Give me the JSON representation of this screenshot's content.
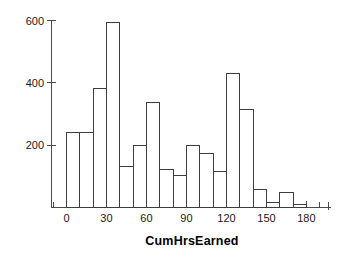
{
  "chart_data": {
    "type": "bar",
    "title": "",
    "subtitle": "",
    "xlabel": "CumHrsEarned",
    "ylabel": "",
    "categories": [
      "0",
      "10",
      "20",
      "30",
      "40",
      "50",
      "60",
      "70",
      "80",
      "90",
      "100",
      "110",
      "120",
      "130",
      "140",
      "150",
      "160",
      "170"
    ],
    "bin_starts": [
      0,
      10,
      20,
      30,
      40,
      50,
      60,
      70,
      80,
      90,
      100,
      110,
      120,
      130,
      140,
      150,
      160,
      170
    ],
    "bin_width": 10,
    "values": [
      240,
      240,
      382,
      592,
      133,
      198,
      338,
      122,
      103,
      200,
      172,
      115,
      430,
      315,
      58,
      15,
      47,
      10
    ],
    "xlim": [
      -10,
      210
    ],
    "ylim": [
      0,
      620
    ],
    "xticks": [
      0,
      30,
      60,
      90,
      120,
      150,
      180
    ],
    "xtick_labels": [
      "0",
      "30",
      "60",
      "90",
      "120",
      "150",
      "180"
    ],
    "xticks_minor": [
      -10,
      10,
      20,
      40,
      50,
      70,
      80,
      100,
      110,
      130,
      140,
      160,
      170,
      190,
      210
    ],
    "yticks": [
      200,
      400,
      600
    ],
    "ytick_labels": [
      "200",
      "400",
      "600"
    ],
    "grid": false,
    "legend": null,
    "bar_fill": "#ffffff",
    "bar_stroke": "#3d3d3d",
    "axis_color": "#4a4a4a"
  },
  "figure": {
    "background": "#ffffff",
    "x_axis_title": "CumHrsEarned"
  }
}
